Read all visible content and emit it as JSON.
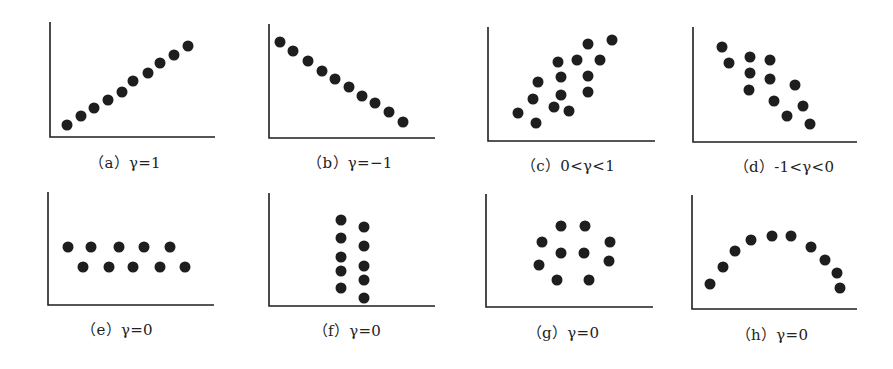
{
  "figure": {
    "dot_color": "#1e1e1e",
    "axis_color": "#1e1e1e",
    "dot_radius": 5.5
  },
  "chart_data": [
    {
      "type": "scatter",
      "id": "a",
      "caption": "（a）γ=1",
      "axis": {
        "x0": 50,
        "y0": 137,
        "top": 22,
        "right": 215
      },
      "caption_pos": [
        125,
        162
      ],
      "points": [
        [
          67,
          125
        ],
        [
          81,
          116
        ],
        [
          94,
          108
        ],
        [
          108,
          100
        ],
        [
          122,
          92
        ],
        [
          133,
          81
        ],
        [
          148,
          73
        ],
        [
          160,
          63
        ],
        [
          174,
          55
        ],
        [
          188,
          46
        ]
      ]
    },
    {
      "type": "scatter",
      "id": "b",
      "caption": "（b）γ=−1",
      "axis": {
        "x0": 269,
        "y0": 138,
        "top": 24,
        "right": 435
      },
      "caption_pos": [
        350,
        162
      ],
      "points": [
        [
          280,
          42
        ],
        [
          293,
          51
        ],
        [
          308,
          61
        ],
        [
          322,
          71
        ],
        [
          335,
          79
        ],
        [
          349,
          87
        ],
        [
          362,
          96
        ],
        [
          375,
          103
        ],
        [
          389,
          112
        ],
        [
          403,
          122
        ]
      ]
    },
    {
      "type": "scatter",
      "id": "c",
      "caption": "（c）0<γ<1",
      "axis": {
        "x0": 488,
        "y0": 141,
        "top": 27,
        "right": 655
      },
      "caption_pos": [
        568,
        165
      ],
      "points": [
        [
          518,
          113
        ],
        [
          536,
          123
        ],
        [
          533,
          99
        ],
        [
          538,
          82
        ],
        [
          558,
          62
        ],
        [
          561,
          77
        ],
        [
          554,
          107
        ],
        [
          561,
          95
        ],
        [
          569,
          111
        ],
        [
          577,
          60
        ],
        [
          588,
          44
        ],
        [
          600,
          60
        ],
        [
          588,
          76
        ],
        [
          588,
          92
        ],
        [
          612,
          40
        ]
      ]
    },
    {
      "type": "scatter",
      "id": "d",
      "caption": "（d）-1<γ<0",
      "axis": {
        "x0": 693,
        "y0": 142,
        "top": 27,
        "right": 857
      },
      "caption_pos": [
        784,
        166
      ],
      "points": [
        [
          722,
          47
        ],
        [
          729,
          63
        ],
        [
          750,
          57
        ],
        [
          750,
          73
        ],
        [
          749,
          90
        ],
        [
          770,
          60
        ],
        [
          770,
          79
        ],
        [
          774,
          101
        ],
        [
          795,
          85
        ],
        [
          787,
          116
        ],
        [
          803,
          106
        ],
        [
          810,
          124
        ]
      ]
    },
    {
      "type": "scatter",
      "id": "e",
      "caption": "（e）γ=0",
      "axis": {
        "x0": 48,
        "y0": 305,
        "top": 192,
        "right": 214
      },
      "caption_pos": [
        117,
        329
      ],
      "points": [
        [
          68,
          247
        ],
        [
          91,
          247
        ],
        [
          119,
          247
        ],
        [
          144,
          247
        ],
        [
          170,
          247
        ],
        [
          83,
          267
        ],
        [
          109,
          267
        ],
        [
          133,
          267
        ],
        [
          160,
          267
        ],
        [
          185,
          267
        ]
      ]
    },
    {
      "type": "scatter",
      "id": "f",
      "caption": "（f）γ=0",
      "axis": {
        "x0": 269,
        "y0": 306,
        "top": 193,
        "right": 435
      },
      "caption_pos": [
        347,
        330
      ],
      "points": [
        [
          341,
          220
        ],
        [
          341,
          238
        ],
        [
          341,
          257
        ],
        [
          341,
          271
        ],
        [
          341,
          288
        ],
        [
          364,
          227
        ],
        [
          364,
          246
        ],
        [
          364,
          266
        ],
        [
          364,
          280
        ],
        [
          364,
          298
        ]
      ]
    },
    {
      "type": "scatter",
      "id": "g",
      "caption": "（g）γ=0",
      "axis": {
        "x0": 486,
        "y0": 307,
        "top": 194,
        "right": 653
      },
      "caption_pos": [
        563,
        332
      ],
      "points": [
        [
          561,
          226
        ],
        [
          585,
          226
        ],
        [
          542,
          242
        ],
        [
          610,
          242
        ],
        [
          561,
          253
        ],
        [
          584,
          253
        ],
        [
          539,
          265
        ],
        [
          609,
          261
        ],
        [
          557,
          280
        ],
        [
          589,
          280
        ]
      ]
    },
    {
      "type": "scatter",
      "id": "h",
      "caption": "（h）γ=0",
      "axis": {
        "x0": 692,
        "y0": 309,
        "top": 195,
        "right": 857
      },
      "caption_pos": [
        772,
        334
      ],
      "points": [
        [
          710,
          284
        ],
        [
          723,
          267
        ],
        [
          735,
          251
        ],
        [
          751,
          240
        ],
        [
          772,
          236
        ],
        [
          791,
          236
        ],
        [
          811,
          247
        ],
        [
          825,
          260
        ],
        [
          837,
          273
        ],
        [
          840,
          288
        ]
      ]
    }
  ]
}
